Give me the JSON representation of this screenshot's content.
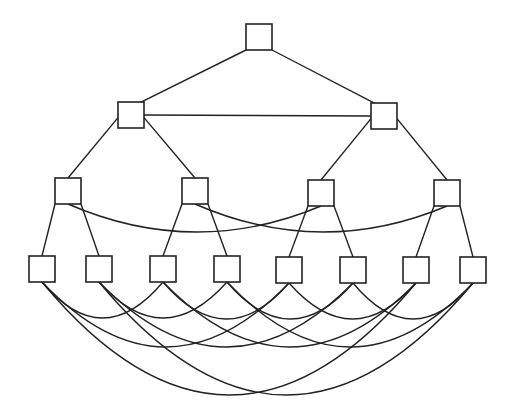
{
  "diagram": {
    "type": "hierarchical-network-graph",
    "background": "#ffffff",
    "stroke_color": "#222222",
    "node_shape": "square",
    "node_size": 26,
    "levels": [
      {
        "level": 1,
        "nodes": [
          {
            "id": "n1",
            "cx": 259,
            "cy": 37
          }
        ]
      },
      {
        "level": 2,
        "nodes": [
          {
            "id": "n2a",
            "cx": 131,
            "cy": 115
          },
          {
            "id": "n2b",
            "cx": 384,
            "cy": 116
          }
        ]
      },
      {
        "level": 3,
        "nodes": [
          {
            "id": "n3a",
            "cx": 68,
            "cy": 191
          },
          {
            "id": "n3b",
            "cx": 195,
            "cy": 191
          },
          {
            "id": "n3c",
            "cx": 321,
            "cy": 193
          },
          {
            "id": "n3d",
            "cx": 447,
            "cy": 193
          }
        ]
      },
      {
        "level": 4,
        "nodes": [
          {
            "id": "n4a",
            "cx": 42,
            "cy": 269
          },
          {
            "id": "n4b",
            "cx": 99,
            "cy": 269
          },
          {
            "id": "n4c",
            "cx": 163,
            "cy": 269
          },
          {
            "id": "n4d",
            "cx": 227,
            "cy": 269
          },
          {
            "id": "n4e",
            "cx": 289,
            "cy": 270
          },
          {
            "id": "n4f",
            "cx": 353,
            "cy": 270
          },
          {
            "id": "n4g",
            "cx": 416,
            "cy": 270
          },
          {
            "id": "n4h",
            "cx": 473,
            "cy": 270
          }
        ]
      }
    ],
    "straight_edges": [
      [
        "n1",
        "n2a"
      ],
      [
        "n1",
        "n2b"
      ],
      [
        "n2a",
        "n2b"
      ],
      [
        "n2a",
        "n3a"
      ],
      [
        "n2a",
        "n3b"
      ],
      [
        "n2b",
        "n3c"
      ],
      [
        "n2b",
        "n3d"
      ],
      [
        "n3a",
        "n4a"
      ],
      [
        "n3a",
        "n4b"
      ],
      [
        "n3b",
        "n4c"
      ],
      [
        "n3b",
        "n4d"
      ],
      [
        "n3c",
        "n4e"
      ],
      [
        "n3c",
        "n4f"
      ],
      [
        "n3d",
        "n4g"
      ],
      [
        "n3d",
        "n4h"
      ]
    ],
    "curved_edges": [
      [
        "n3a",
        "n3c"
      ],
      [
        "n3b",
        "n3d"
      ],
      [
        "n4a",
        "n4c"
      ],
      [
        "n4c",
        "n4e"
      ],
      [
        "n4e",
        "n4g"
      ],
      [
        "n4b",
        "n4d"
      ],
      [
        "n4d",
        "n4f"
      ],
      [
        "n4f",
        "n4h"
      ],
      [
        "n4a",
        "n4e"
      ],
      [
        "n4c",
        "n4g"
      ],
      [
        "n4b",
        "n4f"
      ],
      [
        "n4d",
        "n4h"
      ],
      [
        "n4a",
        "n4g"
      ],
      [
        "n4b",
        "n4h"
      ]
    ]
  }
}
